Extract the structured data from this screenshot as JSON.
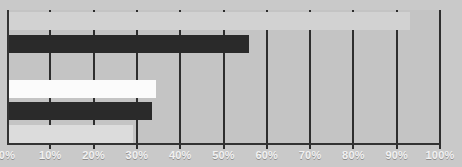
{
  "chart_data": {
    "type": "bar",
    "orientation": "horizontal",
    "title": "",
    "xlabel": "",
    "ylabel": "",
    "xlim": [
      0,
      100
    ],
    "grid": true,
    "legend": "none",
    "categories": [
      "",
      "",
      "",
      "",
      "",
      ""
    ],
    "values": [
      93,
      56,
      0,
      34.5,
      33.5,
      29
    ],
    "bar_colors": [
      "#d2d2d2",
      "#2a2a2a",
      "#c4c4c4",
      "#fbfbfb",
      "#2a2a2a",
      "#dcdcdc"
    ],
    "tick_labels": [
      "0%",
      "10%",
      "20%",
      "30%",
      "40%",
      "50%",
      "60%",
      "70%",
      "80%",
      "90%",
      "100%"
    ],
    "tick_values": [
      0,
      10,
      20,
      30,
      40,
      50,
      60,
      70,
      80,
      90,
      100
    ],
    "bars": [
      {
        "name": "bar-1",
        "value": 93,
        "color": "#d2d2d2"
      },
      {
        "name": "bar-2",
        "value": 56,
        "color": "#2a2a2a"
      },
      {
        "name": "bar-3",
        "value": 0,
        "color": "#c4c4c4"
      },
      {
        "name": "bar-4",
        "value": 34.5,
        "color": "#fbfbfb"
      },
      {
        "name": "bar-5",
        "value": 33.5,
        "color": "#2a2a2a"
      },
      {
        "name": "bar-6",
        "value": 29,
        "color": "#dcdcdc"
      }
    ]
  },
  "colors": {
    "background": "#c9c9c9",
    "plot_background": "#c4c4c4",
    "gridline": "#2e2e2e",
    "axis": "#333333",
    "tick_label": "#f2f2f2"
  }
}
